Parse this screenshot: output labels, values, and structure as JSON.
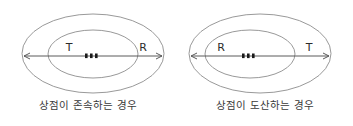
{
  "figure": {
    "background_color": "#ffffff",
    "stroke_color": "#8d8d8d",
    "arrow_color": "#5a5a5a",
    "text_color": "#2b2b2b",
    "panels": [
      {
        "id": "shop-survives",
        "caption": "상점이 존속하는 경우",
        "left_label": "T",
        "right_label": "R",
        "center_dot_count": 3
      },
      {
        "id": "shop-bankrupt",
        "caption": "상점이 도산하는 경우",
        "left_label": "R",
        "right_label": "T",
        "center_dot_count": 3
      }
    ]
  }
}
